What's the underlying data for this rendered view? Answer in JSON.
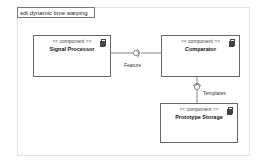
{
  "diagram": {
    "frame_title": "sdt dynamic time warping",
    "components": [
      {
        "stereotype": "<< component >>",
        "name": "Signal Processor"
      },
      {
        "stereotype": "<< component >>",
        "name": "Comparator"
      },
      {
        "stereotype": "<< component >>",
        "name": "Prototype Storage"
      }
    ],
    "interfaces": [
      {
        "label": "Feature"
      },
      {
        "label": "Templates"
      }
    ]
  }
}
